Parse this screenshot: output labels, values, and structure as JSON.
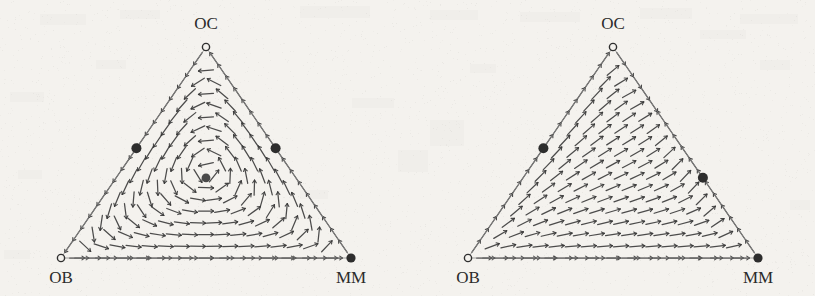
{
  "figure": {
    "type": "phase-portrait-pair",
    "background_color": "#f4f2ee",
    "ink_color": "#3a3a3a",
    "edge_color": "#8a8a8a",
    "panels": [
      {
        "id": "left",
        "name": "left-simplex",
        "vertices": [
          {
            "name": "OC",
            "label": "OC",
            "marker": "open-circle",
            "label_position": "above"
          },
          {
            "name": "OB",
            "label": "OB",
            "marker": "open-circle",
            "label_position": "below"
          },
          {
            "name": "MM",
            "label": "MM",
            "marker": "filled-circle",
            "label_position": "below"
          }
        ],
        "equilibria": [
          {
            "name": "left-edge-saddle",
            "marker": "filled-circle",
            "edge": "OB-OC",
            "fraction_from_OB": 0.52
          },
          {
            "name": "right-edge-saddle",
            "marker": "filled-circle",
            "edge": "MM-OC",
            "fraction_from_MM": 0.52
          },
          {
            "name": "interior-point",
            "marker": "filled-circle-gray",
            "barycentric": [
              0.33,
              0.33,
              0.34
            ]
          },
          {
            "name": "mm-vertex-sink",
            "marker": "filled-circle",
            "vertex": "MM"
          }
        ],
        "flow": "inward-swirl-to-MM"
      },
      {
        "id": "right",
        "name": "right-simplex",
        "vertices": [
          {
            "name": "OC",
            "label": "OC",
            "marker": "open-circle",
            "label_position": "above"
          },
          {
            "name": "OB",
            "label": "OB",
            "marker": "open-circle",
            "label_position": "below"
          },
          {
            "name": "MM",
            "label": "MM",
            "marker": "filled-circle",
            "label_position": "below"
          }
        ],
        "equilibria": [
          {
            "name": "left-edge-saddle",
            "marker": "filled-circle",
            "edge": "OB-OC",
            "fraction_from_OB": 0.52
          },
          {
            "name": "right-edge-saddle",
            "marker": "filled-circle",
            "edge": "MM-OC",
            "fraction_from_MM": 0.38
          },
          {
            "name": "mm-vertex-sink",
            "marker": "filled-circle",
            "vertex": "MM"
          }
        ],
        "flow": "upward-right-to-OC-and-MM"
      }
    ]
  },
  "chart_data": {
    "type": "scatter",
    "title": "",
    "subtitle": "",
    "xlabel": "",
    "ylabel": "",
    "plot_kind": "ternary-simplex-vector-field",
    "categories": [
      "OB",
      "OC",
      "MM"
    ],
    "legend_position": "none",
    "grid": false,
    "panels": [
      {
        "panel": "left",
        "axis_labels": [
          "OB",
          "OC",
          "MM"
        ],
        "markers": [
          {
            "label": "OC",
            "x": 0.0,
            "y": 1.0,
            "style": "open",
            "size": 6
          },
          {
            "label": "OB",
            "x": 0.0,
            "y": 0.0,
            "style": "open",
            "size": 6
          },
          {
            "label": "MM",
            "x": 1.0,
            "y": 0.0,
            "style": "filled",
            "size": 7
          },
          {
            "label": "",
            "x": 0.26,
            "y": 0.52,
            "style": "filled",
            "size": 7,
            "on": "OB-OC edge"
          },
          {
            "label": "",
            "x": 0.74,
            "y": 0.52,
            "style": "filled",
            "size": 7,
            "on": "OC-MM edge"
          },
          {
            "label": "",
            "x": 0.5,
            "y": 0.66,
            "style": "filled-gray",
            "size": 6,
            "on": "interior"
          }
        ]
      },
      {
        "panel": "right",
        "axis_labels": [
          "OB",
          "OC",
          "MM"
        ],
        "markers": [
          {
            "label": "OC",
            "x": 0.0,
            "y": 1.0,
            "style": "open",
            "size": 6
          },
          {
            "label": "OB",
            "x": 0.0,
            "y": 0.0,
            "style": "open",
            "size": 6
          },
          {
            "label": "MM",
            "x": 1.0,
            "y": 0.0,
            "style": "filled",
            "size": 7
          },
          {
            "label": "",
            "x": 0.26,
            "y": 0.52,
            "style": "filled",
            "size": 7,
            "on": "OB-OC edge"
          },
          {
            "label": "",
            "x": 0.81,
            "y": 0.38,
            "style": "filled",
            "size": 7,
            "on": "OC-MM edge"
          }
        ]
      }
    ]
  },
  "labels": {
    "oc": "OC",
    "ob": "OB",
    "mm": "MM"
  }
}
